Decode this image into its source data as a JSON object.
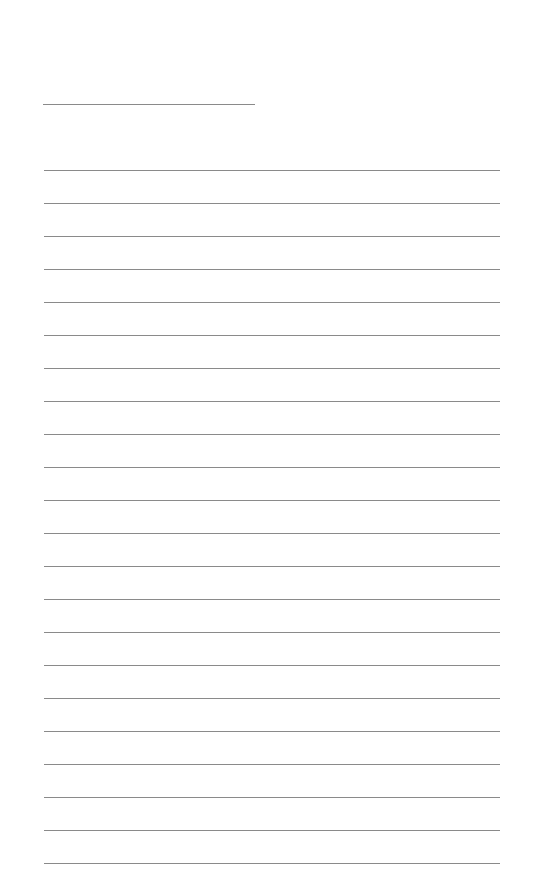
{
  "page": {
    "type": "lined-paper",
    "background": "#ffffff",
    "line_color": "#8a8a8a",
    "header": {
      "name_line": {
        "x": 43,
        "y": 104,
        "width": 212
      }
    },
    "ruled_lines": {
      "count": 22,
      "x": 44,
      "first_y": 170,
      "spacing": 33,
      "width": 456
    }
  }
}
